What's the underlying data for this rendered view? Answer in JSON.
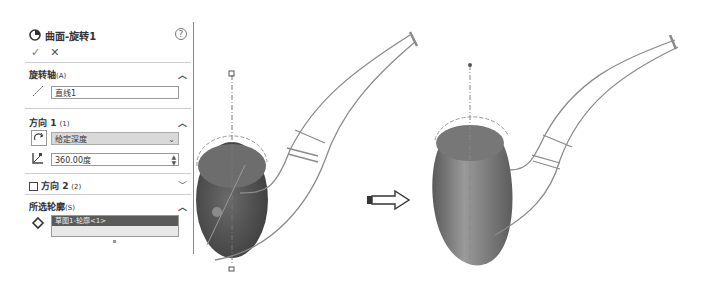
{
  "panel": {
    "title": "曲面-旋转1",
    "help_label": "?",
    "ok_label": "✓",
    "cancel_label": "✕",
    "sections": {
      "axis": {
        "label": "旋转轴",
        "suffix": "(A)",
        "value": "直线1"
      },
      "direction1": {
        "label": "方向 1",
        "suffix": "(1)",
        "type_value": "给定深度",
        "angle_value": "360.00度"
      },
      "direction2": {
        "label": "方向 2",
        "suffix": "(2)",
        "checked": false
      },
      "profiles": {
        "label": "所选轮廓",
        "suffix": "(S)",
        "items": [
          "草图1-轮廓<1>"
        ]
      }
    }
  },
  "arrow": {
    "icon": "right-arrow-icon"
  },
  "viewports": {
    "before": {
      "description": "pipe model with sketch profile, revolve preview"
    },
    "after": {
      "description": "pipe model with revolved surface result"
    }
  }
}
